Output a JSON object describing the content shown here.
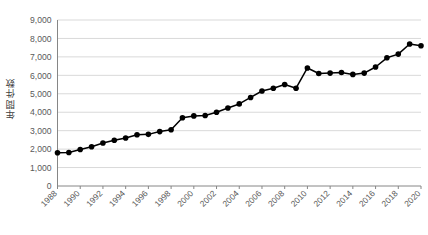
{
  "chart_data": {
    "type": "line",
    "title": "",
    "subtitle": "",
    "xlabel": "",
    "ylabel": "年間件数",
    "ylim": [
      0,
      9000
    ],
    "ytick_labels": [
      "0",
      "1,000",
      "2,000",
      "3,000",
      "4,000",
      "5,000",
      "6,000",
      "7,000",
      "8,000",
      "9,000"
    ],
    "ytick_values": [
      0,
      1000,
      2000,
      3000,
      4000,
      5000,
      6000,
      7000,
      8000,
      9000
    ],
    "xtick_labels": [
      "1988",
      "1990",
      "1992",
      "1994",
      "1996",
      "1998",
      "2000",
      "2002",
      "2004",
      "2006",
      "2008",
      "2010",
      "2012",
      "2014",
      "2016",
      "2018",
      "2020"
    ],
    "grid": true,
    "legend": false,
    "legend_position": "none",
    "marker": "circle",
    "line_color": "#000000",
    "marker_color": "#000000",
    "grid_color": "#d9d9d9",
    "axis_color": "#868686",
    "x": [
      1988,
      1989,
      1990,
      1991,
      1992,
      1993,
      1994,
      1995,
      1996,
      1997,
      1998,
      1999,
      2000,
      2001,
      2002,
      2003,
      2004,
      2005,
      2006,
      2007,
      2008,
      2009,
      2010,
      2011,
      2012,
      2013,
      2014,
      2015,
      2016,
      2017,
      2018,
      2019,
      2020
    ],
    "values": [
      1800,
      1820,
      1980,
      2130,
      2330,
      2480,
      2600,
      2780,
      2800,
      2950,
      3050,
      3700,
      3800,
      3820,
      4000,
      4230,
      4450,
      4800,
      5150,
      5300,
      5500,
      5300,
      6400,
      6100,
      6120,
      6150,
      6050,
      6120,
      6450,
      6950,
      7150,
      7700,
      7600
    ],
    "series": [
      {
        "name": "年間件数",
        "values": [
          1800,
          1820,
          1980,
          2130,
          2330,
          2480,
          2600,
          2780,
          2800,
          2950,
          3050,
          3700,
          3800,
          3820,
          4000,
          4230,
          4450,
          4800,
          5150,
          5300,
          5500,
          5300,
          6400,
          6100,
          6120,
          6150,
          6050,
          6120,
          6450,
          6950,
          7150,
          7700,
          7600
        ]
      }
    ]
  }
}
